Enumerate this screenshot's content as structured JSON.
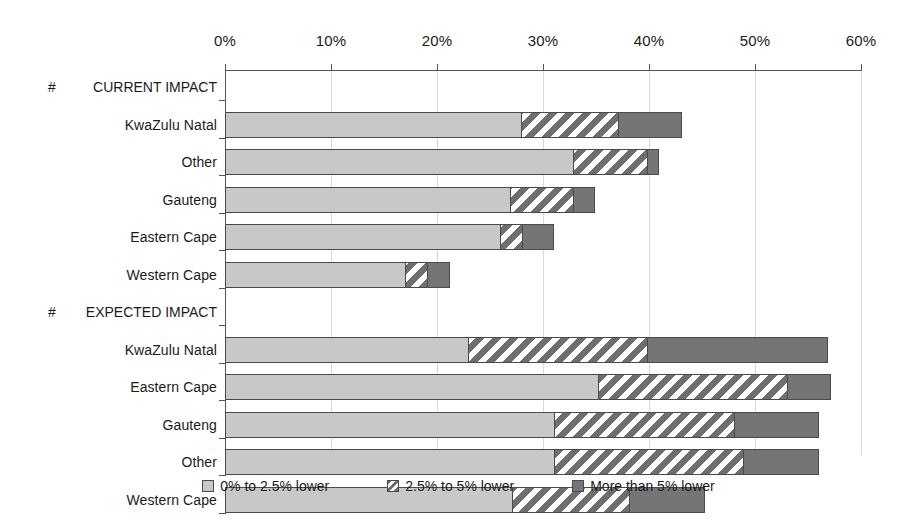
{
  "chart_data": {
    "type": "bar",
    "orientation": "horizontal",
    "stacked": true,
    "title": "",
    "xlabel": "",
    "ylabel": "",
    "xlim": [
      0,
      60
    ],
    "xunit": "%",
    "grid": true,
    "legend_position": "bottom",
    "axis": {
      "ticks": [
        0,
        10,
        20,
        30,
        40,
        50,
        60
      ],
      "tick_labels": [
        "0%",
        "10%",
        "20%",
        "30%",
        "40%",
        "50%",
        "60%"
      ]
    },
    "series": [
      {
        "name": "0% to 2.5% lower",
        "key": "s1",
        "color": "#c8c8c8",
        "pattern": "solid"
      },
      {
        "name": "2.5% to 5% lower",
        "key": "s2",
        "color": "#6e6e6e",
        "pattern": "diagonal-stripe"
      },
      {
        "name": "More than 5% lower",
        "key": "s3",
        "color": "#757575",
        "pattern": "solid"
      }
    ],
    "groups": [
      {
        "heading": "CURRENT IMPACT",
        "heading_marker": "#",
        "rows": [
          {
            "label": "KwaZulu Natal",
            "values": [
              27.9,
              9.2,
              6.0
            ],
            "total": 43.1
          },
          {
            "label": "Other",
            "values": [
              32.8,
              7.0,
              1.1
            ],
            "total": 40.9
          },
          {
            "label": "Gauteng",
            "values": [
              26.9,
              5.9,
              2.1
            ],
            "total": 34.9
          },
          {
            "label": "Eastern Cape",
            "values": [
              25.9,
              2.1,
              3.0
            ],
            "total": 31.0
          },
          {
            "label": "Western Cape",
            "values": [
              17.0,
              2.1,
              2.1
            ],
            "total": 21.2
          }
        ]
      },
      {
        "heading": "EXPECTED IMPACT",
        "heading_marker": "#",
        "rows": [
          {
            "label": "KwaZulu Natal",
            "values": [
              22.9,
              16.9,
              17.1
            ],
            "total": 56.9
          },
          {
            "label": "Eastern Cape",
            "values": [
              35.2,
              17.8,
              4.2
            ],
            "total": 57.2
          },
          {
            "label": "Gauteng",
            "values": [
              31.0,
              17.0,
              8.0
            ],
            "total": 56.0
          },
          {
            "label": "Other",
            "values": [
              31.0,
              17.9,
              7.1
            ],
            "total": 56.0
          },
          {
            "label": "Western Cape",
            "values": [
              27.1,
              11.0,
              7.2
            ],
            "total": 45.3
          }
        ]
      }
    ]
  },
  "legend": {
    "items": [
      {
        "label": "0% to 2.5% lower"
      },
      {
        "label": "2.5% to 5% lower"
      },
      {
        "label": "More than 5% lower"
      }
    ]
  }
}
